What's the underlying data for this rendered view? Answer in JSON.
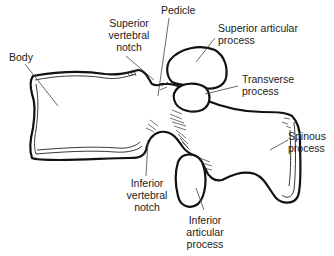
{
  "figure": {
    "labels": [
      {
        "id": "body",
        "text": "Body"
      },
      {
        "id": "superior-vertebral-notch",
        "text": "Superior\nvertebral\nnotch"
      },
      {
        "id": "pedicle",
        "text": "Pedicle"
      },
      {
        "id": "superior-articular-process",
        "text": "Superior articular\nprocess"
      },
      {
        "id": "transverse-process",
        "text": "Transverse\nprocess"
      },
      {
        "id": "spinous-process",
        "text": "Spinous\nprocess"
      },
      {
        "id": "inferior-vertebral-notch",
        "text": "Inferior\nvertebral\nnotch"
      },
      {
        "id": "inferior-articular-process",
        "text": "Inferior\narticular\nprocess"
      }
    ]
  }
}
